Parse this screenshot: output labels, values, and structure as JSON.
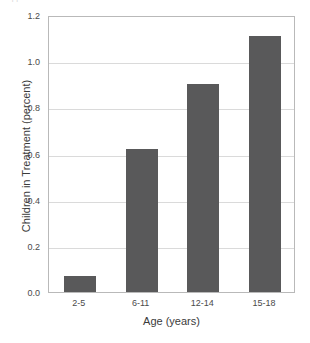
{
  "figure": {
    "top_fragment_text": "cropped header text line",
    "background_color": "#ffffff",
    "frame_color": "#b9b9b9",
    "gridline_color": "#dadada",
    "bar_color": "#59595a"
  },
  "chart_data": {
    "type": "bar",
    "title": "",
    "categories": [
      "2-5",
      "6-11",
      "12-14",
      "15-18"
    ],
    "values": [
      0.07,
      0.62,
      0.9,
      1.11
    ],
    "xlabel": "Age (years)",
    "ylabel": "Children in Treatment (percent)",
    "ylim": [
      0.0,
      1.2
    ],
    "yticks": [
      0.0,
      0.2,
      0.4,
      0.6,
      0.8,
      1.0,
      1.2
    ],
    "ytick_labels": [
      "0.0",
      "0.2",
      "0.4",
      "0.6",
      "0.8",
      "1.0",
      "1.2"
    ],
    "grid": true,
    "grid_axis": "y",
    "legend": null,
    "legend_position": "none",
    "series": [
      {
        "name": "Children in Treatment (percent)",
        "values": [
          0.07,
          0.62,
          0.9,
          1.11
        ],
        "color": "#59595a"
      }
    ]
  }
}
